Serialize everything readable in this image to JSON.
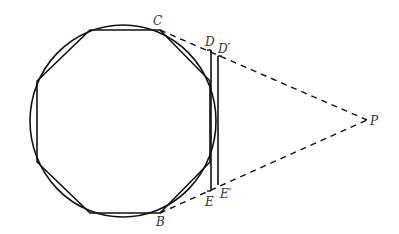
{
  "figure": {
    "colors": {
      "stroke": "#111111",
      "label": "#333333",
      "background": "#ffffff"
    }
  },
  "labels": {
    "C": "C",
    "D": "D",
    "D_prime": "D′",
    "P": "P",
    "E": "E",
    "E_prime": "E′",
    "B": "B"
  },
  "geometry": {
    "circle": {
      "cx": 123,
      "cy": 121,
      "rx": 93,
      "ry": 96
    },
    "octagon": [
      [
        90,
        30
      ],
      [
        160,
        30
      ],
      [
        210,
        81
      ],
      [
        210,
        162
      ],
      [
        160,
        213
      ],
      [
        90,
        213
      ],
      [
        37,
        162
      ],
      [
        37,
        81
      ]
    ],
    "segment_DE": {
      "x": 211,
      "y1": 50,
      "y2": 191
    },
    "segment_DpEp": {
      "x": 218,
      "y1": 56,
      "y2": 185
    },
    "P": [
      367,
      120
    ],
    "C": [
      160,
      30
    ],
    "B": [
      160,
      213
    ]
  }
}
